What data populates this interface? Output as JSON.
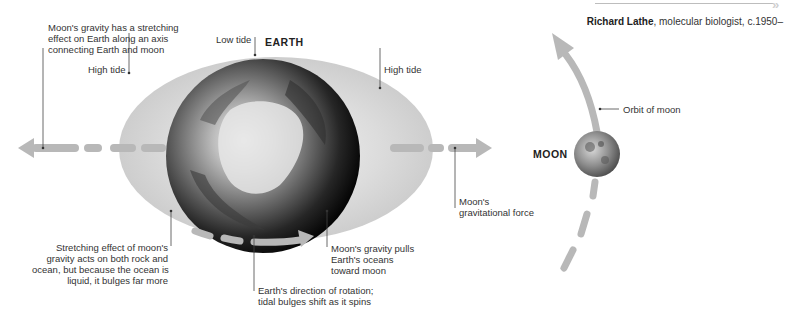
{
  "header": {
    "attribution_name": "Richard Lathe",
    "attribution_rest": ", molecular biologist, c.1950–",
    "chevrons": "»"
  },
  "diagram": {
    "earth_title": "EARTH",
    "moon_title": "MOON",
    "labels": {
      "stretch_axis": [
        "Moon's gravity has a stretching",
        "effect on Earth along an axis",
        "connecting Earth and moon"
      ],
      "low_tide": "Low tide",
      "high_tide_left": "High tide",
      "high_tide_right": "High tide",
      "orbit": "Orbit of moon",
      "grav_force": [
        "Moon's",
        "gravitational force"
      ],
      "stretching_effect": [
        "Stretching effect of moon's",
        "gravity acts on both rock and",
        "ocean, but because the ocean is",
        "liquid, it bulges far more"
      ],
      "pulls_oceans": [
        "Moon's gravity pulls",
        "Earth's oceans",
        "toward moon"
      ],
      "rotation": [
        "Earth's direction of rotation;",
        "tidal bulges shift as it spins"
      ]
    },
    "colors": {
      "bulge": "#d3d3d3",
      "arrow": "#b5b5b5",
      "leader": "#444444",
      "earth_dark": "#111111",
      "earth_light": "#e8e8e8"
    }
  }
}
